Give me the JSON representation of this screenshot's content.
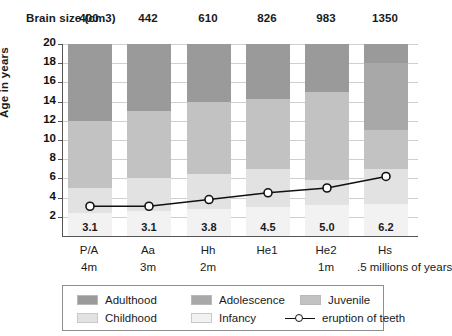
{
  "header": {
    "brain_size_label": "Brain size (cm3)",
    "brain_sizes": [
      "400",
      "442",
      "610",
      "826",
      "983",
      "1350"
    ]
  },
  "axes": {
    "ylabel": "Age in years",
    "yticks": [
      "20",
      "18",
      "16",
      "14",
      "12",
      "10",
      "8",
      "6",
      "4",
      "2"
    ],
    "ylim": [
      0,
      20
    ],
    "xlabels": [
      "P/A",
      "Aa",
      "Hh",
      "He1",
      "He2",
      "Hs"
    ],
    "xsublabels": [
      "4m",
      "3m",
      "2m",
      "",
      "1m",
      ".5 millions of years"
    ]
  },
  "legend": {
    "items": [
      {
        "label": "Adulthood",
        "color": "#9a9a9a"
      },
      {
        "label": "Adolescence",
        "color": "#a8a8a8"
      },
      {
        "label": "Juvenile",
        "color": "#c2c2c2"
      },
      {
        "label": "Childhood",
        "color": "#e2e2e2"
      },
      {
        "label": "Infancy",
        "color": "#f2f2f2"
      },
      {
        "label": "eruption of teeth",
        "color": "#111111"
      }
    ]
  },
  "chart_data": {
    "type": "bar",
    "title": "",
    "xlabel": "",
    "ylabel": "Age in years",
    "ylim": [
      0,
      20
    ],
    "grid": true,
    "legend_position": "bottom",
    "categories": [
      "P/A",
      "Aa",
      "Hh",
      "He1",
      "He2",
      "Hs"
    ],
    "brain_size_cm3": [
      400,
      442,
      610,
      826,
      983,
      1350
    ],
    "millions_of_years": [
      "4m",
      "3m",
      "2m",
      "",
      "1m",
      ".5"
    ],
    "series": [
      {
        "name": "Infancy",
        "values": [
          2.4,
          2.6,
          2.8,
          3.0,
          3.2,
          3.3
        ]
      },
      {
        "name": "Childhood",
        "values": [
          2.6,
          3.4,
          3.7,
          4.0,
          2.6,
          3.7
        ]
      },
      {
        "name": "Juvenile",
        "values": [
          7.0,
          7.0,
          7.5,
          7.3,
          9.2,
          4.0
        ]
      },
      {
        "name": "Adolescence",
        "values": [
          0.0,
          0.0,
          0.0,
          0.0,
          0.0,
          7.0
        ]
      },
      {
        "name": "Adulthood",
        "values": [
          8.0,
          7.0,
          6.0,
          5.7,
          5.0,
          2.0
        ]
      }
    ],
    "eruption_of_teeth": {
      "name": "eruption of teeth",
      "values": [
        3.1,
        3.1,
        3.8,
        4.5,
        5.0,
        6.2
      ],
      "labels": [
        "3.1",
        "3.1",
        "3.8",
        "4.5",
        "5.0",
        "6.2"
      ]
    }
  }
}
